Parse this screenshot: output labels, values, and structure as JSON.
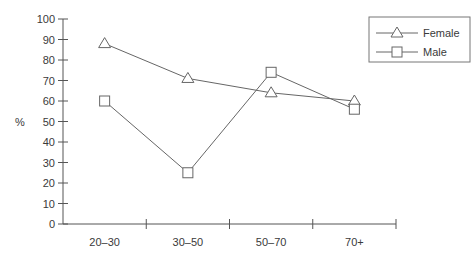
{
  "chart_data": {
    "type": "line",
    "title": "",
    "xlabel": "",
    "ylabel": "%",
    "categories": [
      "20–30",
      "30–50",
      "50–70",
      "70+"
    ],
    "series": [
      {
        "name": "Female",
        "marker": "triangle",
        "values": [
          88,
          71,
          64,
          60
        ]
      },
      {
        "name": "Male",
        "marker": "square",
        "values": [
          60,
          25,
          74,
          56
        ]
      }
    ],
    "ylim": [
      0,
      100
    ],
    "yticks": [
      0,
      10,
      20,
      30,
      40,
      50,
      60,
      70,
      80,
      90,
      100
    ],
    "grid": false,
    "legend_position": "top-right"
  },
  "colors": {
    "axis": "#555555",
    "series": "#666666",
    "text": "#3a3a3a"
  }
}
